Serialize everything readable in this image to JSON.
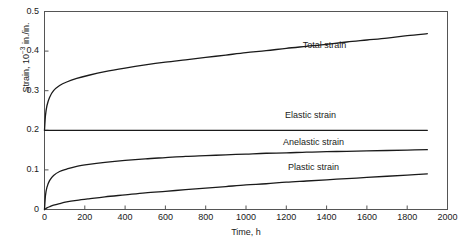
{
  "chart_data": {
    "type": "line",
    "title": "",
    "xlabel": "Time, h",
    "ylabel": "Strain, 10-3 in./in.",
    "ylabel_prefix": "Strain, 10",
    "ylabel_exponent": "−3",
    "ylabel_suffix": " in./in.",
    "xlim": [
      0,
      2000
    ],
    "ylim": [
      0,
      0.5
    ],
    "xticks": [
      0,
      200,
      400,
      600,
      800,
      1000,
      1200,
      1400,
      1600,
      1800,
      2000
    ],
    "xtick_labels": [
      "0",
      "200",
      "400",
      "600",
      "800",
      "1000",
      "1200",
      "1400",
      "1600",
      "1800",
      "2000"
    ],
    "yticks": [
      0,
      0.1,
      0.2,
      0.3,
      0.4,
      0.5
    ],
    "ytick_labels": [
      "0",
      "0.1",
      "0.2",
      "0.3",
      "0.4",
      "0.5"
    ],
    "grid": false,
    "legend_position": "inline-annotations",
    "line_color": "#1a1a1a",
    "frame_color": "#555555",
    "series": [
      {
        "name": "Total strain",
        "label": "Total strain",
        "label_x": 1390,
        "label_y": 0.408,
        "x": [
          0,
          5,
          12,
          25,
          45,
          75,
          110,
          160,
          220,
          300,
          400,
          500,
          600,
          700,
          800,
          900,
          1000,
          1100,
          1200,
          1300,
          1400,
          1500,
          1600,
          1700,
          1800,
          1900
        ],
        "values": [
          0.2,
          0.238,
          0.262,
          0.283,
          0.3,
          0.313,
          0.322,
          0.331,
          0.339,
          0.348,
          0.357,
          0.365,
          0.372,
          0.378,
          0.384,
          0.39,
          0.396,
          0.401,
          0.407,
          0.412,
          0.417,
          0.423,
          0.428,
          0.433,
          0.439,
          0.444
        ]
      },
      {
        "name": "Elastic strain",
        "label": "Elastic strain",
        "label_x": 1320,
        "label_y": 0.232,
        "x": [
          0,
          1900
        ],
        "values": [
          0.2,
          0.2
        ]
      },
      {
        "name": "Anelastic strain",
        "label": "Anelastic strain",
        "label_x": 1335,
        "label_y": 0.164,
        "x": [
          0,
          5,
          12,
          25,
          45,
          75,
          110,
          160,
          220,
          300,
          400,
          500,
          600,
          700,
          800,
          900,
          1000,
          1100,
          1200,
          1300,
          1400,
          1500,
          1600,
          1700,
          1800,
          1900
        ],
        "values": [
          0.0,
          0.036,
          0.056,
          0.073,
          0.086,
          0.096,
          0.102,
          0.109,
          0.114,
          0.119,
          0.124,
          0.128,
          0.131,
          0.134,
          0.136,
          0.138,
          0.14,
          0.142,
          0.143,
          0.145,
          0.146,
          0.147,
          0.148,
          0.149,
          0.15,
          0.151
        ]
      },
      {
        "name": "Plastic strain",
        "label": "Plastic strain",
        "label_x": 1335,
        "label_y": 0.099,
        "x": [
          0,
          5,
          12,
          25,
          45,
          75,
          110,
          160,
          220,
          300,
          400,
          500,
          600,
          700,
          800,
          900,
          1000,
          1100,
          1200,
          1300,
          1400,
          1500,
          1600,
          1700,
          1800,
          1900
        ],
        "values": [
          0.0,
          0.002,
          0.004,
          0.007,
          0.011,
          0.015,
          0.019,
          0.023,
          0.027,
          0.032,
          0.037,
          0.042,
          0.046,
          0.05,
          0.054,
          0.058,
          0.062,
          0.065,
          0.069,
          0.072,
          0.075,
          0.078,
          0.081,
          0.084,
          0.087,
          0.09
        ]
      }
    ]
  }
}
